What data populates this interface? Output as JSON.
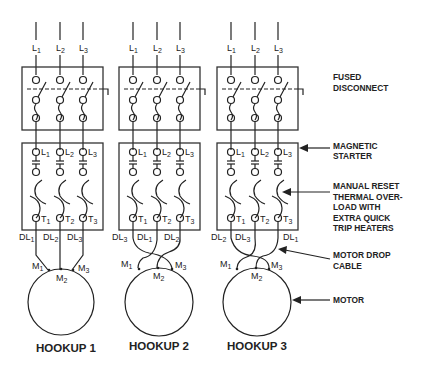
{
  "diagram": {
    "hookups": [
      {
        "title": "HOOKUP 1",
        "line_labels": [
          "L",
          "L",
          "L"
        ],
        "line_subs": [
          "1",
          "2",
          "3"
        ],
        "starter_line_subs": [
          "1",
          "2",
          "3"
        ],
        "terminal_subs": [
          "1",
          "2",
          "3"
        ],
        "drop_labels": [
          "DL",
          "DL",
          "DL"
        ],
        "drop_subs": [
          "1",
          "2",
          "3"
        ],
        "motor_subs": [
          "1",
          "2",
          "3"
        ]
      },
      {
        "title": "HOOKUP 2",
        "line_labels": [
          "L",
          "L",
          "L"
        ],
        "line_subs": [
          "1",
          "2",
          "3"
        ],
        "starter_line_subs": [
          "1",
          "2",
          "3"
        ],
        "terminal_subs": [
          "1",
          "2",
          "3"
        ],
        "drop_labels": [
          "DL",
          "DL",
          "DL"
        ],
        "drop_subs": [
          "3",
          "1",
          "2"
        ],
        "motor_subs": [
          "1",
          "2",
          "3"
        ]
      },
      {
        "title": "HOOKUP 3",
        "line_labels": [
          "L",
          "L",
          "L"
        ],
        "line_subs": [
          "1",
          "2",
          "3"
        ],
        "starter_line_subs": [
          "1",
          "2",
          "3"
        ],
        "terminal_subs": [
          "1",
          "2",
          "3"
        ],
        "drop_labels": [
          "DL",
          "DL",
          "DL"
        ],
        "drop_subs": [
          "2",
          "3",
          "1"
        ],
        "motor_subs": [
          "1",
          "2",
          "3"
        ]
      }
    ],
    "prefix": {
      "line": "L",
      "terminal": "T",
      "drop": "DL",
      "motor": "M"
    },
    "callouts": {
      "fused_disconnect": [
        "FUSED",
        "DISCONNECT"
      ],
      "magnetic_starter": [
        "MAGNETIC",
        "STARTER"
      ],
      "thermal_overload": [
        "MANUAL RESET",
        "THERMAL OVER-",
        "LOAD WITH",
        "EXTRA QUICK",
        "TRIP HEATERS"
      ],
      "motor_drop_cable": [
        "MOTOR DROP",
        "CABLE"
      ],
      "motor": [
        "MOTOR"
      ]
    },
    "colors": {
      "line": "#222222",
      "background": "#ffffff"
    }
  }
}
